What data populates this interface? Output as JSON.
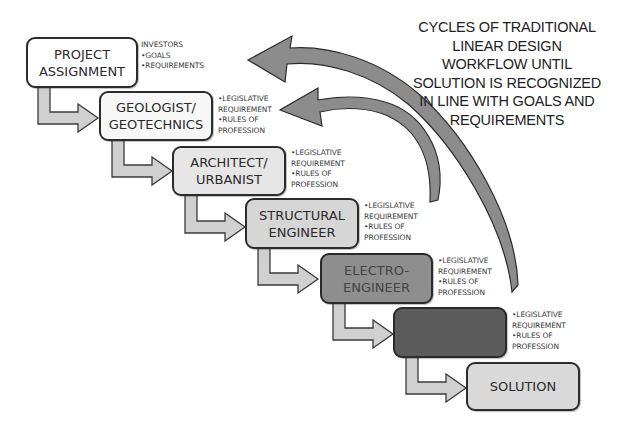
{
  "diagram": {
    "title_lines": [
      "CYCLES OF TRADITIONAL",
      "LINEAR DESIGN",
      "WORKFLOW UNTIL",
      "SOLUTION IS RECOGNIZED",
      "IN LINE WITH GOALS AND",
      "REQUIREMENTS"
    ],
    "steps": [
      {
        "label": "PROJECT\nASSIGNMENT",
        "fill": "#ffffff",
        "notes": [
          "INVESTORS",
          "•GOALS",
          "•REQUIREMENTS"
        ]
      },
      {
        "label": "GEOLOGIST/\nGEOTECHNICS",
        "fill": "#f7f7f7",
        "notes": [
          "•LEGISLATIVE",
          "REQUIREMENT",
          "•RULES OF",
          "PROFESSION"
        ]
      },
      {
        "label": "ARCHITECT/\nURBANIST",
        "fill": "#e6e6e6",
        "notes": [
          "•LEGISLATIVE",
          "REQUIREMENT",
          "•RULES OF",
          "PROFESSION"
        ]
      },
      {
        "label": "STRUCTURAL\nENGINEER",
        "fill": "#d6d6d6",
        "notes": [
          "•LEGISLATIVE",
          "REQUIREMENT",
          "•RULES OF",
          "PROFESSION"
        ]
      },
      {
        "label": "ELECTRO-\nENGINEER",
        "fill": "#8e8e8e",
        "notes": [
          "•LEGISLATIVE",
          "REQUIREMENT",
          "•RULES OF",
          "PROFESSION"
        ]
      },
      {
        "label": "",
        "fill": "#5c5c5c",
        "notes": [
          "•LEGISLATIVE",
          "REQUIREMENT",
          "•RULES OF",
          "PROFESSION"
        ]
      },
      {
        "label": "SOLUTION",
        "fill": "#d9d9d9",
        "notes": []
      }
    ],
    "feedback_arrows": [
      {
        "from": "electro-engineer",
        "to": "project-assignment",
        "color": "#8a8a8a"
      },
      {
        "from": "structural-engineer",
        "to": "geologist-geotechnics",
        "color": "#8a8a8a"
      }
    ]
  }
}
